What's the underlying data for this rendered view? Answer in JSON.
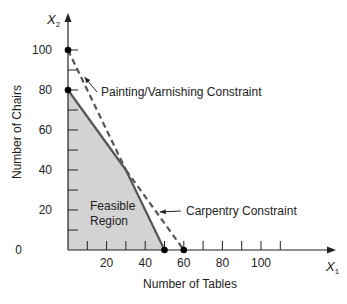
{
  "chart_data": {
    "type": "line",
    "title": "",
    "xlabel": "Number of Tables",
    "ylabel": "Number of Chairs",
    "x_axis_symbol": "X",
    "x_axis_subscript": "1",
    "y_axis_symbol": "X",
    "y_axis_subscript": "2",
    "xlim": [
      0,
      120
    ],
    "ylim": [
      0,
      110
    ],
    "x_ticks": [
      10,
      20,
      30,
      40,
      50,
      60,
      70,
      80,
      90,
      100,
      110
    ],
    "x_tick_labels": [
      {
        "value": 20,
        "label": "20"
      },
      {
        "value": 40,
        "label": "40"
      },
      {
        "value": 60,
        "label": "60"
      },
      {
        "value": 80,
        "label": "80"
      },
      {
        "value": 100,
        "label": "100"
      }
    ],
    "y_ticks": [
      10,
      20,
      30,
      40,
      50,
      60,
      70,
      80,
      90,
      100
    ],
    "y_tick_labels": [
      {
        "value": 0,
        "label": "0"
      },
      {
        "value": 20,
        "label": "20"
      },
      {
        "value": 40,
        "label": "40"
      },
      {
        "value": 60,
        "label": "60"
      },
      {
        "value": 80,
        "label": "80"
      },
      {
        "value": 100,
        "label": "100"
      }
    ],
    "series": [
      {
        "name": "Carpentry Constraint",
        "points": [
          [
            0,
            80
          ],
          [
            60,
            0
          ]
        ]
      },
      {
        "name": "Painting/Varnishing Constraint",
        "points": [
          [
            0,
            100
          ],
          [
            50,
            0
          ]
        ]
      }
    ],
    "feasible_region": {
      "label_lines": [
        "Feasible",
        "Region"
      ],
      "vertices": [
        [
          0,
          0
        ],
        [
          0,
          80
        ],
        [
          30,
          40
        ],
        [
          50,
          0
        ]
      ],
      "fill": "#d3d3d3"
    },
    "marked_points": [
      [
        0,
        100
      ],
      [
        0,
        80
      ],
      [
        50,
        0
      ],
      [
        60,
        0
      ]
    ],
    "annotations": [
      {
        "text": "Painting/Varnishing Constraint",
        "target": [
          7,
          86
        ]
      },
      {
        "text": "Carpentry Constraint",
        "target": [
          46,
          18.5
        ]
      }
    ],
    "grid": false,
    "legend": "none"
  }
}
